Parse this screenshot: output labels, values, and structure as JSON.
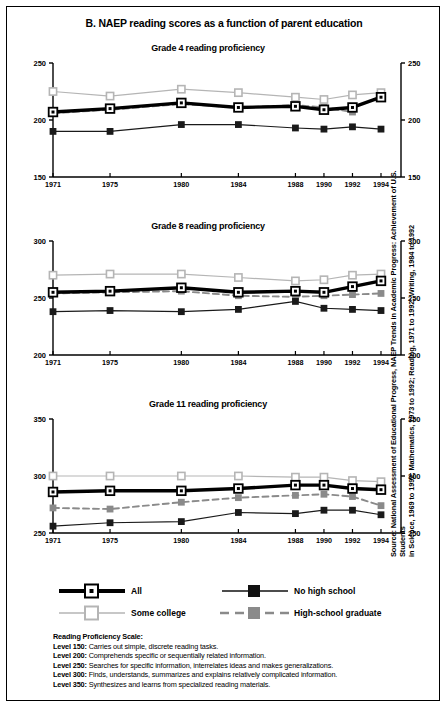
{
  "figure": {
    "title": "B. NAEP reading scores as a function of parent education",
    "source_line1": "Source: National Assessment of Educational Progress, NAEP Trends in Academic Progress: Achievement of U.S. Students",
    "source_line2": "in Science, 1969 to 1992; Mathematics, 1973 to 1992; Reading, 1971 to 1992; Writing, 1984 to 1992"
  },
  "legend": {
    "all": "All",
    "no_high_school": "No high school",
    "some_college": "Some college",
    "high_school_graduate": "High-school graduate"
  },
  "notes": {
    "heading": "Reading Proficiency Scale:",
    "items": [
      {
        "level": "Level 150:",
        "text": "Carries out simple, discrete reading tasks."
      },
      {
        "level": "Level 200:",
        "text": "Comprehends specific or sequentially related information."
      },
      {
        "level": "Level 250:",
        "text": "Searches for specific information, interrelates ideas and makes generalizations."
      },
      {
        "level": "Level 300:",
        "text": "Finds, understands, summarizes and explains relatively complicated information."
      },
      {
        "level": "Level 350:",
        "text": "Synthesizes and learns from specialized reading materials."
      }
    ]
  },
  "colors": {
    "all": "#000000",
    "no_high_school": "#1a1a1a",
    "some_college": "#b5b5b5",
    "high_school_graduate": "#8a8a8a",
    "frame": "#000000"
  },
  "chart_data": [
    {
      "type": "line",
      "title": "Grade 4 reading proficiency",
      "xlabel": "",
      "ylabel": "",
      "x": [
        1971,
        1975,
        1980,
        1984,
        1988,
        1990,
        1992,
        1994
      ],
      "categories": [
        "1971",
        "1975",
        "1980",
        "1984",
        "1988",
        "1990",
        "1992",
        "1994"
      ],
      "ylim": [
        150,
        250
      ],
      "yticks": [
        150,
        200,
        250
      ],
      "grid": false,
      "legend_position": "below-figure",
      "series": [
        {
          "name": "All",
          "values": [
            207,
            210,
            215,
            211,
            212,
            209,
            211,
            220
          ]
        },
        {
          "name": "No high school",
          "values": [
            190,
            190,
            196,
            196,
            193,
            192,
            194,
            192
          ]
        },
        {
          "name": "Some college",
          "values": [
            225,
            221,
            227,
            224,
            220,
            218,
            222,
            224
          ]
        },
        {
          "name": "High-school graduate",
          "values": [
            206,
            209,
            214,
            211,
            213,
            211,
            207,
            null
          ]
        }
      ]
    },
    {
      "type": "line",
      "title": "Grade 8 reading proficiency",
      "xlabel": "",
      "ylabel": "",
      "x": [
        1971,
        1975,
        1980,
        1984,
        1988,
        1990,
        1992,
        1994
      ],
      "categories": [
        "1971",
        "1975",
        "1980",
        "1984",
        "1988",
        "1990",
        "1992",
        "1994"
      ],
      "ylim": [
        200,
        300
      ],
      "yticks": [
        200,
        250,
        300
      ],
      "grid": false,
      "legend_position": "below-figure",
      "series": [
        {
          "name": "All",
          "values": [
            255,
            256,
            259,
            255,
            256,
            255,
            260,
            265
          ]
        },
        {
          "name": "No high school",
          "values": [
            238,
            239,
            238,
            240,
            247,
            241,
            240,
            239
          ]
        },
        {
          "name": "Some college",
          "values": [
            270,
            271,
            271,
            268,
            265,
            266,
            270,
            271
          ]
        },
        {
          "name": "High-school graduate",
          "values": [
            254,
            255,
            256,
            252,
            251,
            252,
            253,
            254
          ]
        }
      ]
    },
    {
      "type": "line",
      "title": "Grade 11 reading proficiency",
      "xlabel": "",
      "ylabel": "",
      "x": [
        1971,
        1975,
        1980,
        1984,
        1988,
        1990,
        1992,
        1994
      ],
      "categories": [
        "1971",
        "1975",
        "1980",
        "1984",
        "1988",
        "1990",
        "1992",
        "1994"
      ],
      "ylim": [
        250,
        350
      ],
      "yticks": [
        250,
        300,
        350
      ],
      "grid": false,
      "legend_position": "below-figure",
      "series": [
        {
          "name": "All",
          "values": [
            286,
            287,
            287,
            289,
            292,
            292,
            289,
            288
          ]
        },
        {
          "name": "No high school",
          "values": [
            256,
            259,
            260,
            268,
            267,
            270,
            270,
            266
          ]
        },
        {
          "name": "Some college",
          "values": [
            300,
            300,
            300,
            300,
            299,
            299,
            296,
            295
          ]
        },
        {
          "name": "High-school graduate",
          "values": [
            272,
            271,
            277,
            281,
            283,
            284,
            282,
            274
          ]
        }
      ]
    }
  ]
}
